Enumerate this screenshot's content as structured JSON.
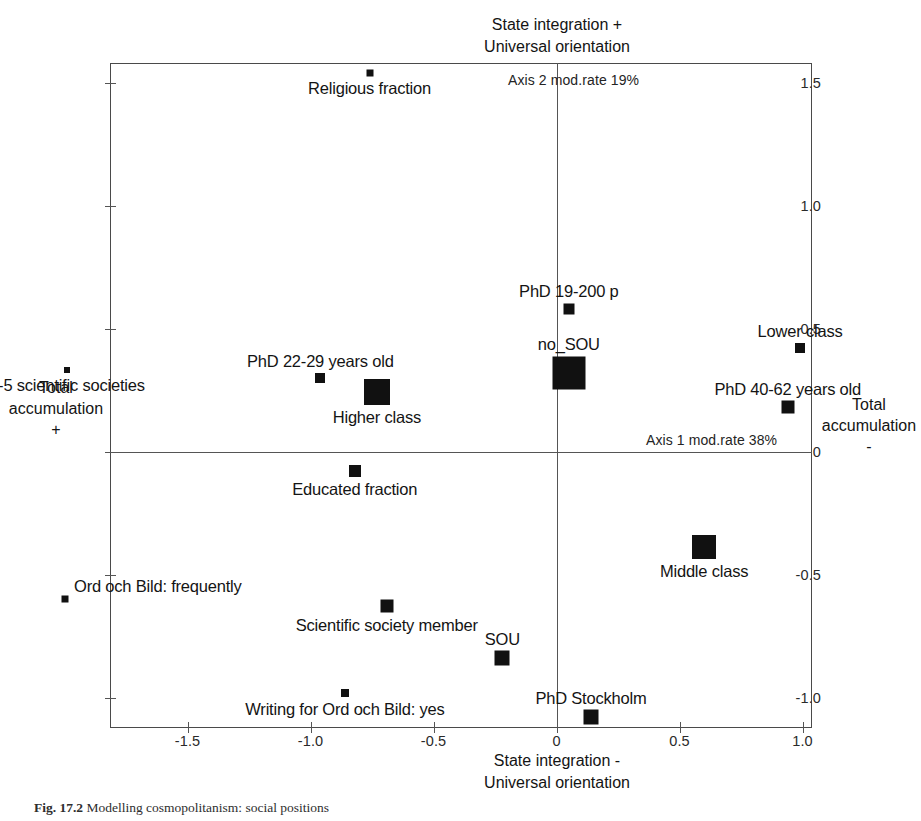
{
  "figure": {
    "caption_label": "Fig. 17.2",
    "caption_text": "Modelling cosmopolitanism: social positions"
  },
  "chart_data": {
    "type": "scatter",
    "title": "",
    "xlabel": "State integration -\nUniversal orientation",
    "ylabel": "Total accumulation +",
    "xlim": [
      -1.85,
      1.08
    ],
    "ylim": [
      -1.2,
      1.65
    ],
    "grid": false,
    "legend": "none",
    "axis_top_label_line1": "State integration +",
    "axis_top_label_line2": "Universal orientation",
    "axis_bottom_label_line1": "State integration -",
    "axis_bottom_label_line2": "Universal orientation",
    "axis_left_label_line1": "Total",
    "axis_left_label_line2": "accumulation",
    "axis_left_label_line3": "+",
    "axis_right_label_line1": "Total",
    "axis_right_label_line2": "accumulation",
    "axis_right_label_line3": "-",
    "axis1_mod_rate": "Axis 1 mod.rate 38%",
    "axis2_mod_rate": "Axis 2 mod.rate 19%",
    "xticks": [
      -1.5,
      -1.0,
      -0.5,
      0,
      0.5,
      1.0
    ],
    "xticklabels": [
      "-1.5",
      "-1.0",
      "-0.5",
      "0",
      "0.5",
      "1.0"
    ],
    "yticks": [
      1.5,
      1.0,
      0.5,
      0,
      -0.5,
      -1.0
    ],
    "yticklabels": [
      "1.5",
      "1.0",
      "0.5",
      "0",
      "-0.5",
      "-1.0"
    ],
    "points": [
      {
        "label": "Religious fraction",
        "x": -0.76,
        "y": 1.54,
        "size": 7,
        "label_pos": "center-below"
      },
      {
        "label": "PhD 19-200 p",
        "x": 0.05,
        "y": 0.58,
        "size": 11,
        "label_pos": "center-above"
      },
      {
        "label": "no_SOU",
        "x": 0.05,
        "y": 0.32,
        "size": 33,
        "label_pos": "center-above"
      },
      {
        "label": "Lower class",
        "x": 0.99,
        "y": 0.42,
        "size": 10,
        "label_pos": "center-above"
      },
      {
        "label": "PhD 40-62 years old",
        "x": 0.94,
        "y": 0.18,
        "size": 13,
        "label_pos": "center-above"
      },
      {
        "label": "2-5 scientific societies",
        "x": -1.99,
        "y": 0.33,
        "size": 6,
        "label_pos": "center-below"
      },
      {
        "label": "PhD 22-29 years old",
        "x": -0.96,
        "y": 0.3,
        "size": 10,
        "label_pos": "center-above"
      },
      {
        "label": "Higher class",
        "x": -0.73,
        "y": 0.24,
        "size": 26,
        "label_pos": "center-below"
      },
      {
        "label": "Educated fraction",
        "x": -0.82,
        "y": -0.08,
        "size": 12,
        "label_pos": "center-below"
      },
      {
        "label": "Middle class",
        "x": 0.6,
        "y": -0.39,
        "size": 24,
        "label_pos": "center-below"
      },
      {
        "label": "Ord och Bild: frequently",
        "x": -2.0,
        "y": -0.6,
        "size": 7,
        "label_pos": "right-above"
      },
      {
        "label": "Scientific society member",
        "x": -0.69,
        "y": -0.63,
        "size": 13,
        "label_pos": "center-below"
      },
      {
        "label": "SOU",
        "x": -0.22,
        "y": -0.84,
        "size": 15,
        "label_pos": "center-above"
      },
      {
        "label": "Writing for Ord och Bild: yes",
        "x": -0.86,
        "y": -0.98,
        "size": 8,
        "label_pos": "center-below"
      },
      {
        "label": "PhD Stockholm",
        "x": 0.14,
        "y": -1.08,
        "size": 15,
        "label_pos": "center-above"
      }
    ]
  }
}
